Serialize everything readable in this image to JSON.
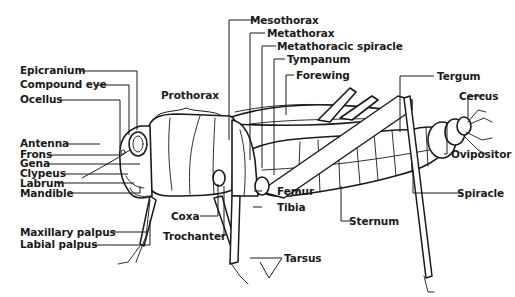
{
  "diagram": {
    "labels": {
      "epicranium": "Epicranium",
      "compound_eye": "Compound eye",
      "ocellus": "Ocellus",
      "antenna": "Antenna",
      "frons": "Frons",
      "gena": "Gena",
      "clypeus": "Clypeus",
      "labrum": "Labrum",
      "mandible": "Mandible",
      "maxillary_palpus": "Maxillary palpus",
      "labial_palpus": "Labial palpus",
      "prothorax": "Prothorax",
      "mesothorax": "Mesothorax",
      "metathorax": "Metathorax",
      "metathoracic_spiracle": "Metathoracic spiracle",
      "tympanum": "Tympanum",
      "forewing": "Forewing",
      "coxa": "Coxa",
      "trochanter": "Trochanter",
      "femur": "Femur",
      "tibia": "Tibia",
      "tarsus": "Tarsus",
      "sternum": "Sternum",
      "tergum": "Tergum",
      "cercus": "Cercus",
      "ovipositor": "Ovipositor",
      "spiracle": "Spiracle"
    }
  }
}
